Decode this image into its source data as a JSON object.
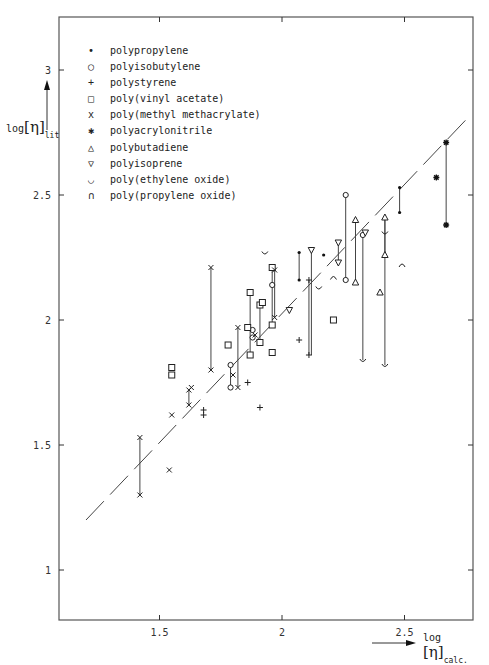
{
  "chart_data": {
    "type": "scatter",
    "title": "",
    "xlabel": "log [η] calc.",
    "ylabel": "log [η] lit",
    "xlim": [
      1.09,
      2.78
    ],
    "ylim": [
      0.8,
      3.2
    ],
    "xticks": [
      1.5,
      2,
      2.5
    ],
    "yticks": [
      1,
      1.5,
      2,
      2.5,
      3
    ],
    "xtick_labels": [
      "1.5",
      "2",
      "2.5"
    ],
    "ytick_labels": [
      "1",
      "1.5",
      "2",
      "2.5",
      "3"
    ],
    "grid": false,
    "legend_position": "upper left",
    "reference_line": {
      "style": "dashed",
      "x": [
        1.2,
        2.75
      ],
      "y": [
        1.2,
        2.8
      ]
    },
    "series": [
      {
        "name": "polypropylene",
        "marker": "dot",
        "points": [
          [
            2.07,
            2.27
          ],
          [
            2.07,
            2.16
          ],
          [
            2.17,
            2.26
          ],
          [
            2.48,
            2.53
          ],
          [
            2.48,
            2.43
          ]
        ],
        "ranges": [
          [
            2.07,
            2.16,
            2.27
          ],
          [
            2.48,
            2.43,
            2.53
          ]
        ]
      },
      {
        "name": "polyisobutylene",
        "marker": "circle",
        "points": [
          [
            1.79,
            1.82
          ],
          [
            1.79,
            1.73
          ],
          [
            1.88,
            1.96
          ],
          [
            1.88,
            1.93
          ],
          [
            1.96,
            2.14
          ],
          [
            2.26,
            2.5
          ],
          [
            2.26,
            2.16
          ],
          [
            2.33,
            2.34
          ]
        ],
        "ranges": [
          [
            1.79,
            1.73,
            1.82
          ],
          [
            2.26,
            2.16,
            2.5
          ]
        ]
      },
      {
        "name": "polystyrene",
        "marker": "plus",
        "points": [
          [
            1.68,
            1.64
          ],
          [
            1.68,
            1.62
          ],
          [
            1.86,
            1.75
          ],
          [
            1.91,
            1.65
          ],
          [
            2.07,
            1.92
          ],
          [
            2.11,
            2.16
          ],
          [
            2.11,
            1.86
          ]
        ],
        "ranges": [
          [
            2.11,
            1.86,
            2.16
          ]
        ]
      },
      {
        "name": "poly(vinyl acetate)",
        "marker": "square",
        "points": [
          [
            1.55,
            1.81
          ],
          [
            1.55,
            1.78
          ],
          [
            1.78,
            1.9
          ],
          [
            1.87,
            2.11
          ],
          [
            1.87,
            1.86
          ],
          [
            1.86,
            1.97
          ],
          [
            1.91,
            2.06
          ],
          [
            1.92,
            2.07
          ],
          [
            1.91,
            1.91
          ],
          [
            1.96,
            2.21
          ],
          [
            1.96,
            1.98
          ],
          [
            1.96,
            1.87
          ],
          [
            2.21,
            2.0
          ]
        ],
        "ranges": [
          [
            1.87,
            1.86,
            2.11
          ],
          [
            1.91,
            1.91,
            2.06
          ],
          [
            1.96,
            1.98,
            2.21
          ]
        ]
      },
      {
        "name": "poly(methyl methacrylate)",
        "marker": "cross",
        "points": [
          [
            1.42,
            1.53
          ],
          [
            1.42,
            1.3
          ],
          [
            1.54,
            1.4
          ],
          [
            1.55,
            1.62
          ],
          [
            1.62,
            1.72
          ],
          [
            1.63,
            1.73
          ],
          [
            1.62,
            1.66
          ],
          [
            1.71,
            2.21
          ],
          [
            1.71,
            1.8
          ],
          [
            1.8,
            1.78
          ],
          [
            1.82,
            1.97
          ],
          [
            1.82,
            1.73
          ],
          [
            1.89,
            1.94
          ],
          [
            1.97,
            2.2
          ],
          [
            1.97,
            2.01
          ]
        ],
        "ranges": [
          [
            1.42,
            1.3,
            1.53
          ],
          [
            1.62,
            1.66,
            1.72
          ],
          [
            1.71,
            1.8,
            2.21
          ],
          [
            1.82,
            1.73,
            1.97
          ],
          [
            1.97,
            2.01,
            2.2
          ]
        ]
      },
      {
        "name": "polyacrylonitrile",
        "marker": "star",
        "points": [
          [
            2.63,
            2.57
          ],
          [
            2.67,
            2.71
          ],
          [
            2.67,
            2.38
          ]
        ],
        "ranges": [
          [
            2.67,
            2.38,
            2.71
          ]
        ]
      },
      {
        "name": "polybutadiene",
        "marker": "triangle-up",
        "points": [
          [
            2.3,
            2.4
          ],
          [
            2.3,
            2.15
          ],
          [
            2.4,
            2.11
          ],
          [
            2.42,
            2.41
          ],
          [
            2.42,
            2.26
          ]
        ],
        "ranges": [
          [
            2.3,
            2.15,
            2.4
          ],
          [
            2.42,
            2.26,
            2.41
          ]
        ]
      },
      {
        "name": "polyisoprene",
        "marker": "triangle-down",
        "points": [
          [
            2.03,
            2.04
          ],
          [
            2.12,
            2.28
          ],
          [
            2.23,
            2.31
          ],
          [
            2.23,
            2.23
          ],
          [
            2.34,
            2.35
          ]
        ],
        "ranges": [
          [
            2.12,
            1.86,
            2.28
          ],
          [
            2.23,
            2.23,
            2.31
          ]
        ]
      },
      {
        "name": "poly(ethylene oxide)",
        "marker": "cup",
        "points": [
          [
            1.93,
            2.27
          ],
          [
            2.15,
            2.13
          ],
          [
            2.33,
            1.84
          ],
          [
            2.42,
            2.35
          ],
          [
            2.42,
            1.82
          ]
        ],
        "ranges": [
          [
            2.33,
            1.84,
            2.34
          ],
          [
            2.42,
            1.82,
            2.41
          ]
        ]
      },
      {
        "name": "poly(propylene oxide)",
        "marker": "cap",
        "points": [
          [
            2.21,
            2.17
          ],
          [
            2.49,
            2.22
          ]
        ],
        "ranges": []
      }
    ]
  },
  "legend": {
    "items": [
      {
        "symbol": "•",
        "label": "polypropylene"
      },
      {
        "symbol": "○",
        "label": "polyisobutylene"
      },
      {
        "symbol": "+",
        "label": "polystyrene"
      },
      {
        "symbol": "□",
        "label": "poly(vinyl acetate)"
      },
      {
        "symbol": "x",
        "label": "poly(methyl methacrylate)"
      },
      {
        "symbol": "✱",
        "label": "polyacrylonitrile"
      },
      {
        "symbol": "△",
        "label": "polybutadiene"
      },
      {
        "symbol": "▽",
        "label": "polyisoprene"
      },
      {
        "symbol": "◡",
        "label": "poly(ethylene oxide)"
      },
      {
        "symbol": "∩",
        "label": "poly(propylene oxide)"
      }
    ]
  },
  "axes": {
    "y_label_main": "log",
    "y_label_eta": "[η]",
    "y_label_sub": "lit",
    "x_label_main": "log",
    "x_label_eta": "[η]",
    "x_label_sub": "calc."
  }
}
